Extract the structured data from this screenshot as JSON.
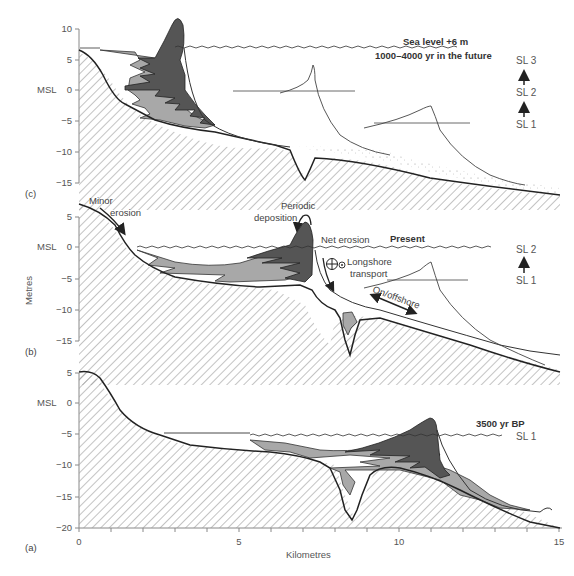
{
  "figure": {
    "y_axis_title": "Metres",
    "x_axis_title": "Kilometres",
    "x_ticks": [
      "0",
      "5",
      "10",
      "15"
    ],
    "colors": {
      "dark_sediment": "#555555",
      "mid_sediment": "#a8a8a8",
      "hatch": "#9a9a9a",
      "line": "#222222",
      "axis": "#888888"
    }
  },
  "panels": {
    "c": {
      "label": "(c)",
      "y_ticks": [
        "10",
        "5",
        "0",
        "−5",
        "−10",
        "−15"
      ],
      "msl_label": "MSL",
      "sea_level_title": "Sea level +6 m",
      "time_note": "1000–4000 yr in the future",
      "sl_stack": [
        "SL 3",
        "SL 2",
        "SL 1"
      ]
    },
    "b": {
      "label": "(b)",
      "y_ticks": [
        "5",
        "0",
        "−5",
        "−10",
        "−15"
      ],
      "msl_label": "MSL",
      "title": "Present",
      "annotations": {
        "minor_erosion_1": "Minor",
        "minor_erosion_2": "erosion",
        "periodic_1": "Periodic",
        "periodic_2": "deposition",
        "net_erosion": "Net erosion",
        "longshore_1": "Longshore",
        "longshore_2": "transport",
        "onoffshore": "On/offshore"
      },
      "sl_stack": [
        "SL 2",
        "SL 1"
      ]
    },
    "a": {
      "label": "(a)",
      "y_ticks": [
        "5",
        "0",
        "−5",
        "−10",
        "−15",
        "−20"
      ],
      "msl_label": "MSL",
      "title": "3500 yr BP",
      "sl_stack": [
        "SL 1"
      ]
    }
  }
}
